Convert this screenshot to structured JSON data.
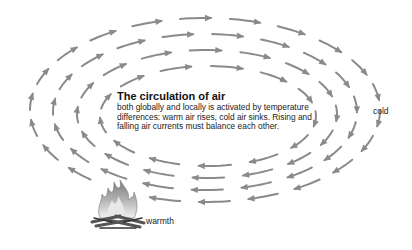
{
  "diagram": {
    "title": "The circulation of air",
    "description": "both globally and locally is activated by temperature differences: warm air rises, cold air sinks. Rising and falling air currents must balance each other.",
    "labels": {
      "cold": "cold",
      "warmth": "warmth"
    },
    "arrow_color": "#8a8a8a",
    "flow_direction": "clockwise",
    "rings": [
      {
        "cx": 205,
        "cy": 110,
        "rx": 175,
        "ry": 92,
        "count": 22
      },
      {
        "cx": 205,
        "cy": 112,
        "rx": 152,
        "ry": 78,
        "count": 19
      },
      {
        "cx": 207,
        "cy": 114,
        "rx": 130,
        "ry": 64,
        "count": 16
      },
      {
        "cx": 208,
        "cy": 116,
        "rx": 108,
        "ry": 50,
        "count": 13
      }
    ],
    "heat_source": "campfire-icon"
  }
}
